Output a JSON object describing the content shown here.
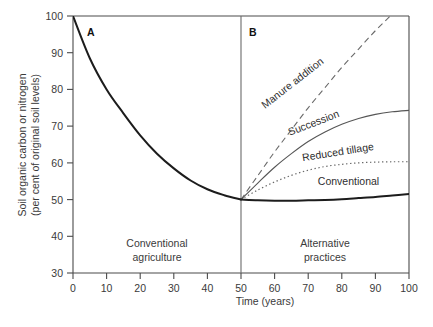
{
  "chart_data": {
    "type": "line",
    "title": "",
    "xlabel": "Time (years)",
    "ylabel": "Soil organic carbon or nitrogen",
    "ylabel_line2": "(per cent of original soil levels)",
    "xlim": [
      0,
      100
    ],
    "ylim": [
      30,
      100
    ],
    "xticks": [
      0,
      10,
      20,
      30,
      40,
      50,
      60,
      70,
      80,
      90,
      100
    ],
    "yticks": [
      30,
      40,
      50,
      60,
      70,
      80,
      90,
      100
    ],
    "grid": false,
    "legend_position": "inline-curve-labels",
    "panels": [
      {
        "letter": "A",
        "region_label_line1": "Conventional",
        "region_label_line2": "agriculture",
        "x_range": [
          0,
          50
        ]
      },
      {
        "letter": "B",
        "region_label_line1": "Alternative",
        "region_label_line2": "practices",
        "x_range": [
          50,
          100
        ]
      }
    ],
    "divider_x": 50,
    "series": [
      {
        "name": "Conventional agriculture decline",
        "label": "",
        "style": "solid-thick",
        "x": [
          0,
          5,
          10,
          15,
          20,
          25,
          30,
          35,
          40,
          45,
          50
        ],
        "y": [
          100,
          88.5,
          80.0,
          73.5,
          67.5,
          62.5,
          58.5,
          55.2,
          52.8,
          51.2,
          50.0
        ]
      },
      {
        "name": "Manure addition",
        "label": "Manure addition",
        "style": "dashed",
        "x": [
          50,
          55,
          60,
          65,
          70,
          75,
          80,
          85,
          90,
          95,
          100
        ],
        "y": [
          50.0,
          56.5,
          63.0,
          69.0,
          75.0,
          80.5,
          86.0,
          91.0,
          96.0,
          100.5,
          105.0
        ]
      },
      {
        "name": "Succession",
        "label": "Succession",
        "style": "solid-thin",
        "x": [
          50,
          55,
          60,
          65,
          70,
          75,
          80,
          85,
          90,
          95,
          100
        ],
        "y": [
          50.0,
          54.5,
          58.8,
          62.5,
          65.8,
          68.4,
          70.5,
          72.1,
          73.2,
          73.9,
          74.3
        ]
      },
      {
        "name": "Reduced tillage",
        "label": "Reduced tillage",
        "style": "dotted",
        "x": [
          50,
          55,
          60,
          65,
          70,
          75,
          80,
          85,
          90,
          95,
          100
        ],
        "y": [
          50.0,
          52.6,
          54.8,
          56.6,
          58.0,
          59.0,
          59.6,
          60.0,
          60.2,
          60.3,
          60.3
        ]
      },
      {
        "name": "Conventional",
        "label": "Conventional",
        "style": "solid-thick",
        "x": [
          50,
          55,
          60,
          65,
          70,
          75,
          80,
          85,
          90,
          95,
          100
        ],
        "y": [
          50.0,
          49.8,
          49.7,
          49.7,
          49.8,
          49.9,
          50.1,
          50.4,
          50.7,
          51.1,
          51.5
        ]
      }
    ],
    "curve_label_positions": [
      {
        "name": "manure-addition",
        "x": 66,
        "y": 81,
        "rotation": -38
      },
      {
        "name": "succession",
        "x": 72,
        "y": 70,
        "rotation": -21
      },
      {
        "name": "reduced-tillage",
        "x": 79,
        "y": 62,
        "rotation": -9
      },
      {
        "name": "conventional",
        "x": 82,
        "y": 54,
        "rotation": 0
      }
    ]
  }
}
